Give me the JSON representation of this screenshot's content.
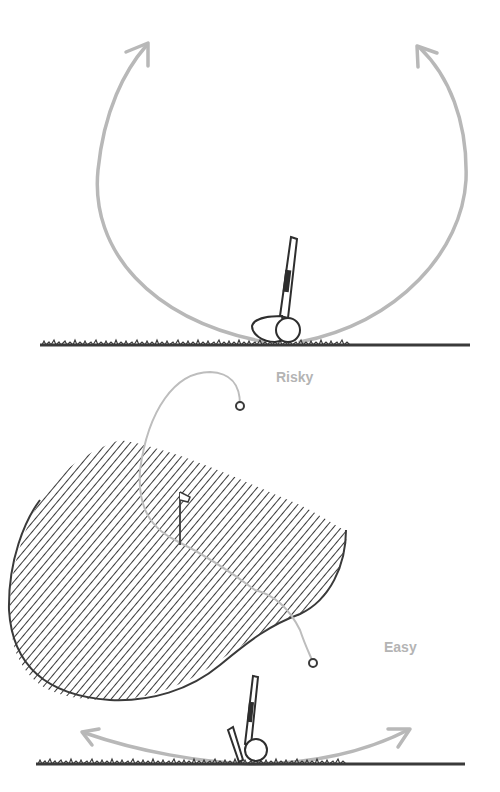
{
  "figure": {
    "top_panel": {
      "description": "Club face swing arcs showing upward trajectories",
      "arrows": [
        "left-upward-arc-arrow",
        "right-upward-arc-arrow"
      ]
    },
    "bottom_panel": {
      "labels": {
        "risky": "Risky",
        "easy": "Easy"
      },
      "elements": [
        "hazard-hatched-area",
        "flag",
        "risky-shot-path",
        "easy-shot-path",
        "ball-marker",
        "ground-line"
      ]
    },
    "colors": {
      "ink": "#3a3a3a",
      "arrow": "#b8b8b8",
      "path": "#bdbdbd",
      "label": "#b4b4b4"
    }
  }
}
